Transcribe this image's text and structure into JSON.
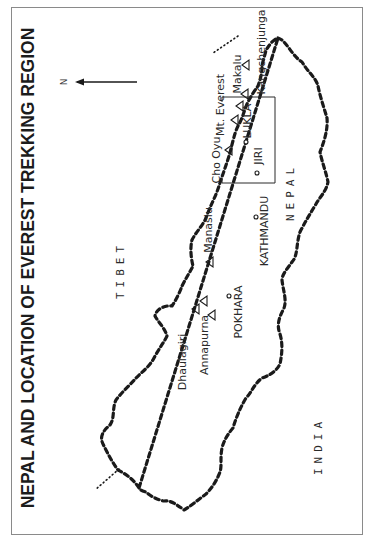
{
  "map": {
    "title": "NEPAL AND LOCATION OF EVEREST TREKKING REGION",
    "orientation": "rotated 90° counter-clockwise",
    "north_label": "N",
    "countries": {
      "north": "TIBET",
      "center": "NEPAL",
      "south": "INDIA"
    },
    "peaks": [
      {
        "name": "Dhaulagiri"
      },
      {
        "name": "Annapurna"
      },
      {
        "name": "Manaslu"
      },
      {
        "name": "Cho Oyu"
      },
      {
        "name": "Mt. Everest"
      },
      {
        "name": "Makalu"
      },
      {
        "name": "Kangchenjunga"
      }
    ],
    "towns": [
      {
        "name": "POKHARA"
      },
      {
        "name": "KATHMANDU"
      },
      {
        "name": "JIRI"
      },
      {
        "name": "LUKLA"
      }
    ],
    "legend_symbols": {
      "peak": "triangle",
      "town": "small circle",
      "national_border": "heavy dashed line",
      "international_tripoint": "dotted line",
      "trekking_region": "rectangle box"
    },
    "colors": {
      "ink": "#1a1a1a",
      "frame": "#8a8a8a",
      "background": "#ffffff"
    }
  }
}
